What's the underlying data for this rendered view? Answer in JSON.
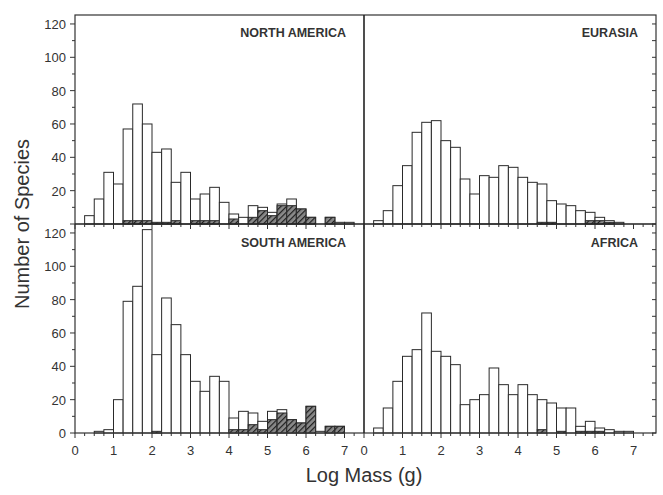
{
  "chart_data": {
    "type": "bar",
    "subtype": "histogram-small-multiples",
    "xlabel": "Log Mass (g)",
    "ylabel": "Number of Species",
    "bin_width": 0.25,
    "xlim": [
      0,
      7.5
    ],
    "ylim": [
      0,
      125
    ],
    "xticks": [
      0,
      1,
      2,
      3,
      4,
      5,
      6,
      7
    ],
    "yticks": [
      20,
      40,
      60,
      80,
      100,
      120
    ],
    "yticks_bottom": [
      0,
      20,
      40,
      60,
      80,
      100,
      120
    ],
    "legend": [
      {
        "name": "Extant species",
        "style": "open"
      },
      {
        "name": "Extinct species",
        "style": "hatched"
      }
    ],
    "panels": [
      {
        "title": "NORTH AMERICA",
        "position": "top-left",
        "bin_starts": [
          0.25,
          0.5,
          0.75,
          1.0,
          1.25,
          1.5,
          1.75,
          2.0,
          2.25,
          2.5,
          2.75,
          3.0,
          3.25,
          3.5,
          3.75,
          4.0,
          4.25,
          4.5,
          4.75,
          5.0,
          5.25,
          5.5,
          5.75,
          6.0,
          6.25,
          6.5,
          6.75,
          7.0
        ],
        "total": [
          5,
          15,
          31,
          24,
          57,
          72,
          60,
          43,
          45,
          25,
          31,
          15,
          18,
          22,
          13,
          6,
          4,
          11,
          10,
          7,
          12,
          15,
          9,
          4,
          0,
          4,
          1,
          1
        ],
        "extinct": [
          0,
          0,
          0,
          0,
          2,
          2,
          2,
          1,
          1,
          2,
          0,
          2,
          2,
          2,
          0,
          3,
          0,
          4,
          8,
          5,
          11,
          11,
          9,
          4,
          0,
          4,
          0,
          0
        ]
      },
      {
        "title": "EURASIA",
        "position": "top-right",
        "bin_starts": [
          0.25,
          0.5,
          0.75,
          1.0,
          1.25,
          1.5,
          1.75,
          2.0,
          2.25,
          2.5,
          2.75,
          3.0,
          3.25,
          3.5,
          3.75,
          4.0,
          4.25,
          4.5,
          4.75,
          5.0,
          5.25,
          5.5,
          5.75,
          6.0,
          6.25,
          6.5
        ],
        "total": [
          2,
          8,
          23,
          35,
          55,
          61,
          62,
          50,
          46,
          27,
          18,
          29,
          28,
          35,
          34,
          28,
          25,
          24,
          14,
          12,
          11,
          8,
          7,
          4,
          2,
          1
        ],
        "extinct": [
          0,
          0,
          0,
          0,
          0,
          0,
          0,
          0,
          0,
          0,
          0,
          0,
          0,
          0,
          0,
          0,
          0,
          1,
          1,
          0,
          0,
          0,
          2,
          2,
          1,
          0
        ]
      },
      {
        "title": "SOUTH AMERICA",
        "position": "bottom-left",
        "bin_starts": [
          0.5,
          0.75,
          1.0,
          1.25,
          1.5,
          1.75,
          2.0,
          2.25,
          2.5,
          2.75,
          3.0,
          3.25,
          3.5,
          3.75,
          4.0,
          4.25,
          4.5,
          4.75,
          5.0,
          5.25,
          5.5,
          5.75,
          6.0,
          6.25,
          6.5,
          6.75
        ],
        "total": [
          1,
          2,
          20,
          79,
          88,
          122,
          47,
          81,
          65,
          47,
          31,
          25,
          34,
          31,
          9,
          13,
          12,
          7,
          13,
          14,
          8,
          6,
          16,
          1,
          4,
          4
        ],
        "extinct": [
          0,
          0,
          0,
          0,
          0,
          0,
          1,
          0,
          0,
          0,
          0,
          0,
          0,
          0,
          2,
          2,
          5,
          2,
          8,
          12,
          8,
          6,
          16,
          0,
          4,
          4
        ]
      },
      {
        "title": "AFRICA",
        "position": "bottom-right",
        "bin_starts": [
          0.25,
          0.5,
          0.75,
          1.0,
          1.25,
          1.5,
          1.75,
          2.0,
          2.25,
          2.5,
          2.75,
          3.0,
          3.25,
          3.5,
          3.75,
          4.0,
          4.25,
          4.5,
          4.75,
          5.0,
          5.25,
          5.5,
          5.75,
          6.0,
          6.25,
          6.5,
          6.75
        ],
        "total": [
          3,
          15,
          31,
          46,
          50,
          72,
          49,
          46,
          41,
          17,
          20,
          23,
          39,
          29,
          23,
          29,
          23,
          20,
          18,
          15,
          15,
          4,
          7,
          3,
          2,
          1,
          1
        ],
        "extinct": [
          0,
          0,
          0,
          0,
          0,
          0,
          0,
          0,
          0,
          0,
          0,
          0,
          0,
          0,
          0,
          0,
          0,
          2,
          0,
          1,
          0,
          1,
          1,
          1,
          0,
          0,
          0
        ]
      }
    ]
  }
}
